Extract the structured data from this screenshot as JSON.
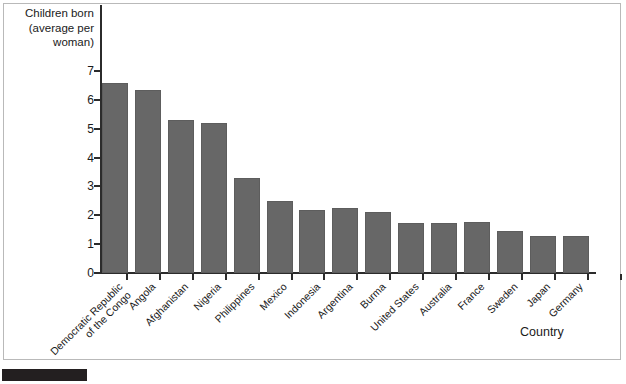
{
  "axes": {
    "y_title": "Children born\n(average per\nwoman)",
    "x_title": "Country",
    "y_ticks": [
      "0",
      "1",
      "2",
      "3",
      "4",
      "5",
      "6",
      "7"
    ]
  },
  "style": {
    "bar_color": "#676767",
    "axis_color": "#2b2b2b",
    "frame_color": "#b9b9b9",
    "marker_color": "#231f20"
  },
  "chart_data": {
    "type": "bar",
    "title": "",
    "xlabel": "Country",
    "ylabel": "Children born (average per woman)",
    "ylim": [
      0,
      7
    ],
    "yticks": [
      0,
      1,
      2,
      3,
      4,
      5,
      6,
      7
    ],
    "grid": false,
    "legend": "none",
    "orientation": "vertical",
    "categories": [
      "Democratic Republic\nof the Congo",
      "Angola",
      "Afghanistan",
      "Nigeria",
      "Philippines",
      "Mexico",
      "Indonesia",
      "Argentina",
      "Burma",
      "United States",
      "Australia",
      "France",
      "Sweden",
      "Japan",
      "Germany"
    ],
    "values": [
      6.6,
      6.35,
      5.3,
      5.2,
      3.3,
      2.5,
      2.2,
      2.25,
      2.1,
      1.75,
      1.75,
      1.78,
      1.45,
      1.3,
      1.28
    ]
  }
}
